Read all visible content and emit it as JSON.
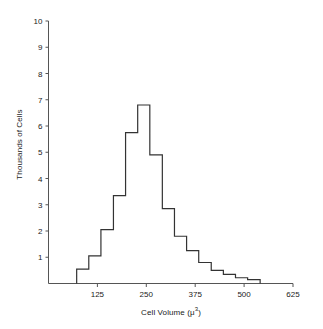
{
  "chart_data": {
    "type": "bar",
    "title": "",
    "subtitle": "",
    "xlabel": "Cell Volume (μ3)",
    "xlabel_base": "Cell Volume (μ",
    "xlabel_sup": "3",
    "xlabel_close": ")",
    "ylabel": "Thousands of Cells",
    "xlim": [
      0,
      625
    ],
    "ylim": [
      0,
      10
    ],
    "xticks": [
      125,
      250,
      375,
      500,
      625
    ],
    "xtick_labels": [
      "125",
      "250",
      "375",
      "500",
      "625"
    ],
    "yticks": [
      1,
      2,
      3,
      4,
      5,
      6,
      7,
      8,
      9,
      10
    ],
    "ytick_labels": [
      "1",
      "2",
      "3",
      "4",
      "5",
      "6",
      "7",
      "8",
      "9",
      "10"
    ],
    "grid": false,
    "legend": "none",
    "bin_width": 31.25,
    "bin_start": 72,
    "bin_edges": [
      72,
      103,
      134,
      166,
      197,
      228,
      259,
      291,
      322,
      353,
      384,
      416,
      447,
      478,
      509,
      541
    ],
    "values": [
      0.55,
      1.05,
      2.05,
      3.35,
      5.75,
      6.8,
      4.9,
      2.85,
      1.8,
      1.25,
      0.8,
      0.5,
      0.35,
      0.22,
      0.15
    ],
    "series": [
      {
        "name": "Cell count distribution",
        "values": [
          0.55,
          1.05,
          2.05,
          3.35,
          5.75,
          6.8,
          4.9,
          2.85,
          1.8,
          1.25,
          0.8,
          0.5,
          0.35,
          0.22,
          0.15
        ]
      }
    ],
    "categories": [
      "72-103",
      "103-134",
      "134-166",
      "166-197",
      "197-228",
      "228-259",
      "259-291",
      "291-322",
      "322-353",
      "353-384",
      "384-416",
      "416-447",
      "447-478",
      "478-509",
      "509-541"
    ],
    "line_color": "#333333",
    "axis_color": "#555555"
  }
}
